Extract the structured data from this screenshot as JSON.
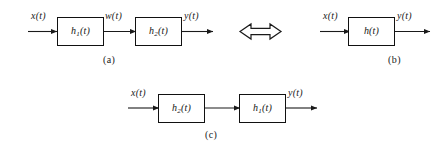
{
  "figure": {
    "background_color": "#ffffff",
    "line_color": "#1a1a1a",
    "box_border_color": "#111111"
  },
  "equivalence": {
    "symbol_name": "left-right-double-arrow",
    "glyph": "⟺"
  },
  "panel_a": {
    "caption": "(a)",
    "input_label": "x(t)",
    "intermediate_label": "w(t)",
    "output_label": "y(t)",
    "blocks": [
      {
        "base": "h",
        "subscript": "1",
        "arg": "(t)",
        "full": "h1(t)"
      },
      {
        "base": "h",
        "subscript": "2",
        "arg": "(t)",
        "full": "h2(t)"
      }
    ]
  },
  "panel_b": {
    "caption": "(b)",
    "input_label": "x(t)",
    "output_label": "y(t)",
    "blocks": [
      {
        "base": "h",
        "subscript": "",
        "arg": "(t)",
        "full": "h(t)"
      }
    ]
  },
  "panel_c": {
    "caption": "(c)",
    "input_label": "x(t)",
    "output_label": "y(t)",
    "blocks": [
      {
        "base": "h",
        "subscript": "2",
        "arg": "(t)",
        "full": "h2(t)"
      },
      {
        "base": "h",
        "subscript": "1",
        "arg": "(t)",
        "full": "h1(t)"
      }
    ]
  }
}
